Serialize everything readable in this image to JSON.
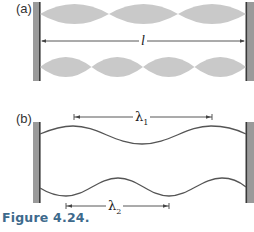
{
  "figure": {
    "caption": "Figure 4.24.",
    "panel_a": {
      "label": "(a)",
      "length_label": "l",
      "modes": [
        {
          "name": "three-loop standing wave",
          "loops": 3
        },
        {
          "name": "four-loop standing wave",
          "loops": 4
        }
      ]
    },
    "panel_b": {
      "label": "(b)",
      "waves": [
        {
          "name": "wave-1",
          "wavelength_label": "λ",
          "subscript": "1"
        },
        {
          "name": "wave-2",
          "wavelength_label": "λ",
          "subscript": "2"
        }
      ]
    },
    "colors": {
      "wall": "#9a9a9a",
      "wall_edge": "#3a3a3a",
      "loop_fill": "#c9c9c9",
      "string": "#555555",
      "caption": "#3d6a8c"
    }
  }
}
